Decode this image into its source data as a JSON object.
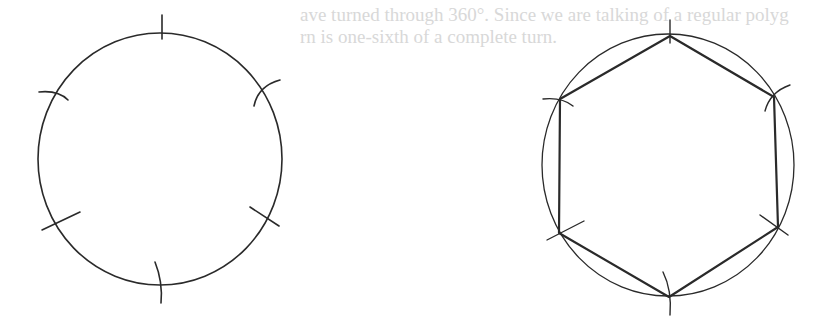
{
  "page": {
    "background_color": "#ffffff",
    "ink_color": "#2a2a2a",
    "bleed_text_color": "#d8d8d8"
  },
  "bleed_text": {
    "line1": "ave turned through 360°. Since we are talking of a regular polyg",
    "line2": "rn is one-sixth of a complete turn."
  },
  "figures": {
    "left": {
      "description": "Circle with six arc marks stepped around the circumference",
      "circle": {
        "cx": 160,
        "cy": 159,
        "rx": 122,
        "ry": 126
      },
      "marks": [
        {
          "x1": 162,
          "y1": 15,
          "x2": 162,
          "y2": 39
        },
        {
          "x1": 254,
          "y1": 80,
          "x2": 280,
          "y2": 106,
          "curve": true
        },
        {
          "x1": 39,
          "y1": 92,
          "x2": 67,
          "y2": 100,
          "curve": true
        },
        {
          "x1": 42,
          "y1": 230,
          "x2": 80,
          "y2": 212
        },
        {
          "x1": 250,
          "y1": 211,
          "x2": 279,
          "y2": 226
        },
        {
          "x1": 155,
          "y1": 262,
          "x2": 161,
          "y2": 303,
          "curve": true
        }
      ]
    },
    "right": {
      "description": "Regular hexagon inscribed in circle, vertices at arc marks",
      "circle": {
        "cx": 668,
        "cy": 165,
        "rx": 126,
        "ry": 131
      },
      "vertices": [
        [
          670,
          36
        ],
        [
          774,
          97
        ],
        [
          778,
          227
        ],
        [
          669,
          297
        ],
        [
          559,
          233
        ],
        [
          560,
          99
        ]
      ]
    }
  }
}
